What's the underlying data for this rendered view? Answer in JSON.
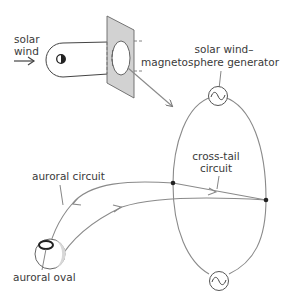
{
  "diagram": {
    "labels": {
      "solar_wind_line1": "solar",
      "solar_wind_line2": "wind",
      "generator_line1": "solar wind–",
      "generator_line2": "magnetosphere generator",
      "cross_tail_line1": "cross-tail",
      "cross_tail_line2": "circuit",
      "auroral_circuit": "auroral circuit",
      "auroral_oval": "auroral oval"
    },
    "icons": {
      "solar_wind_arrow": "right-arrow",
      "earth": "half-shaded-circle",
      "generator_top": "ac-source-sine",
      "generator_bottom": "ac-source-sine"
    },
    "colors": {
      "line": "#8a8a8a",
      "plane_fill": "#cfcfcf",
      "text": "#3a3a3a",
      "node": "#222222"
    }
  }
}
